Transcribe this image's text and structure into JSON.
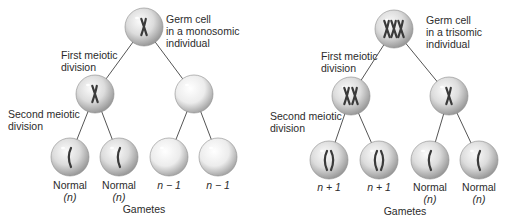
{
  "panels": [
    {
      "id": "monosomic",
      "germ_cell_label": [
        "Germ cell",
        "in a monosomic",
        "individual"
      ],
      "first_division_label": [
        "First meiotic",
        "division"
      ],
      "second_division_label": [
        "Second meiotic",
        "division"
      ],
      "germ_cell_chromosomes": 1,
      "first_division_cells": [
        {
          "chromosomes": 1
        },
        {
          "chromosomes": 0
        }
      ],
      "gametes": [
        {
          "label": "Normal",
          "sublabel": "(n)",
          "chromosomes": 1
        },
        {
          "label": "Normal",
          "sublabel": "(n)",
          "chromosomes": 1
        },
        {
          "label": "n − 1",
          "sublabel": "",
          "chromosomes": 0
        },
        {
          "label": "n − 1",
          "sublabel": "",
          "chromosomes": 0
        }
      ],
      "gametes_label": "Gametes"
    },
    {
      "id": "trisomic",
      "germ_cell_label": [
        "Germ cell",
        "in a trisomic",
        "individual"
      ],
      "first_division_label": [
        "First meiotic",
        "division"
      ],
      "second_division_label": [
        "Second meiotic",
        "division"
      ],
      "germ_cell_chromosomes": 3,
      "first_division_cells": [
        {
          "chromosomes": 2
        },
        {
          "chromosomes": 1
        }
      ],
      "gametes": [
        {
          "label": "n + 1",
          "sublabel": "",
          "chromosomes": 2
        },
        {
          "label": "n + 1",
          "sublabel": "",
          "chromosomes": 2
        },
        {
          "label": "Normal",
          "sublabel": "(n)",
          "chromosomes": 1
        },
        {
          "label": "Normal",
          "sublabel": "(n)",
          "chromosomes": 1
        }
      ],
      "gametes_label": "Gametes"
    }
  ],
  "colors": {
    "cell_light": "#f4f4f4",
    "cell_dark": "#9a9a9a",
    "chromosome": "#3a3a3a",
    "line": "#555555"
  }
}
